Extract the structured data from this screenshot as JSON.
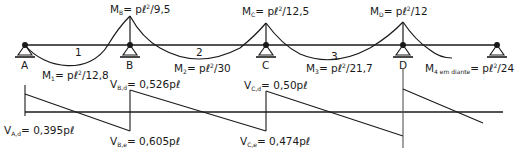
{
  "diagram": {
    "type": "continuous-beam-moment-and-shear",
    "colors": {
      "line": "#1a1a1a",
      "text": "#1a1a1a",
      "background": "#ffffff"
    },
    "beam": {
      "supports": [
        {
          "label": "A",
          "x": 25
        },
        {
          "label": "B",
          "x": 130
        },
        {
          "label": "C",
          "x": 266
        },
        {
          "label": "D",
          "x": 403
        },
        {
          "label": "",
          "x": 497
        }
      ],
      "spans": [
        {
          "label": "1",
          "x": 77
        },
        {
          "label": "2",
          "x": 198
        },
        {
          "label": "3",
          "x": 333
        }
      ]
    },
    "moments": {
      "MB": {
        "sym": "M",
        "sub": "B",
        "expr_pre": "= p",
        "expr_post": "/9,5",
        "sup": "2"
      },
      "MC": {
        "sym": "M",
        "sub": "C",
        "expr_pre": "= p",
        "expr_post": "/12,5",
        "sup": "2"
      },
      "MD": {
        "sym": "M",
        "sub": "D",
        "expr_pre": "= p",
        "expr_post": "/12",
        "sup": "2"
      },
      "M1": {
        "sym": "M",
        "sub": "1",
        "expr_pre": "= p",
        "expr_post": "/12,8",
        "sup": "2"
      },
      "M2": {
        "sym": "M",
        "sub": "2",
        "expr_pre": "= p",
        "expr_post": "/30",
        "sup": "2"
      },
      "M3": {
        "sym": "M",
        "sub": "3",
        "expr_pre": "= p",
        "expr_post": "/21,7",
        "sup": "2"
      },
      "M4": {
        "sym": "M",
        "sub": "4 em diante",
        "expr_pre": "= p",
        "expr_post": "/24",
        "sup": "2"
      }
    },
    "shears": {
      "VAd": {
        "sym": "V",
        "sub": "A,d",
        "value": "= 0,395p"
      },
      "VBd": {
        "sym": "V",
        "sub": "B,d",
        "value": "= 0,526p"
      },
      "VBe": {
        "sym": "V",
        "sub": "B,e",
        "value": "= 0,605p"
      },
      "VCd": {
        "sym": "V",
        "sub": "C,d",
        "value": "= 0,50p"
      },
      "VCe": {
        "sym": "V",
        "sub": "C,e",
        "value": "= 0,474p"
      }
    },
    "ell": "ℓ"
  }
}
